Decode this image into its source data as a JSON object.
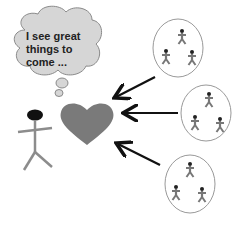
{
  "thought_bubble": {
    "text_lines": [
      "I see great",
      "things to",
      "come ..."
    ]
  },
  "colors": {
    "bubble_fill": "#d6d6d6",
    "bubble_stroke": "#8a8a8a",
    "heart": "#7a7a7a",
    "person_head": "#111111",
    "person_body": "#8c8c8c",
    "arrow": "#111111",
    "group_circle": "#999999",
    "group_figures": "#777777"
  },
  "groups": [
    {
      "label": "group-1",
      "figures": 3
    },
    {
      "label": "group-2",
      "figures": 3
    },
    {
      "label": "group-3",
      "figures": 3
    }
  ]
}
